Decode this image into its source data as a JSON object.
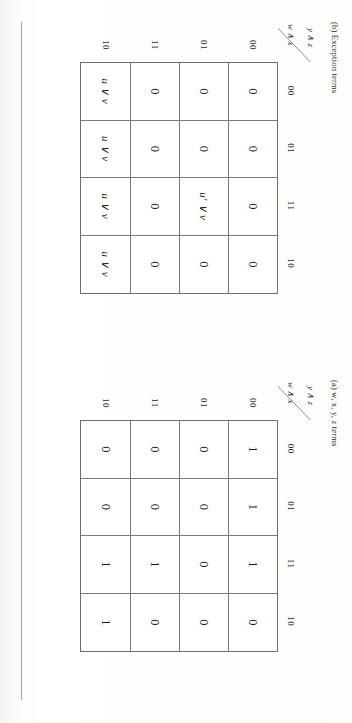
{
  "page": {
    "background_color": "#fdfdfb",
    "rule_color": "#a9a9a6"
  },
  "figures": [
    {
      "id": "exception-terms",
      "caption": "(b) Exception terms",
      "col_axis_label": "y ∧ z",
      "row_axis_label": "w ∧ x",
      "col_headers": [
        "00",
        "01",
        "11",
        "10"
      ],
      "row_headers": [
        "00",
        "01",
        "11",
        "10"
      ],
      "cells": [
        [
          "0",
          "0",
          "0",
          "0"
        ],
        [
          "0",
          "0",
          "u' ∨ v",
          "0"
        ],
        [
          "0",
          "0",
          "0",
          "0"
        ],
        [
          "u ∨ v",
          "u ∨ v",
          "u ∨ v",
          "u ∨ v"
        ]
      ]
    },
    {
      "id": "wxyz-terms",
      "caption": "(a) w, x, y, z terms",
      "col_axis_label": "y ∧ z",
      "row_axis_label": "w ∧ x",
      "col_headers": [
        "00",
        "01",
        "11",
        "10"
      ],
      "row_headers": [
        "00",
        "01",
        "11",
        "10"
      ],
      "cells": [
        [
          "1",
          "1",
          "1",
          "0"
        ],
        [
          "0",
          "0",
          "0",
          "0"
        ],
        [
          "0",
          "0",
          "1",
          "0"
        ],
        [
          "0",
          "0",
          "1",
          "1"
        ]
      ]
    }
  ]
}
